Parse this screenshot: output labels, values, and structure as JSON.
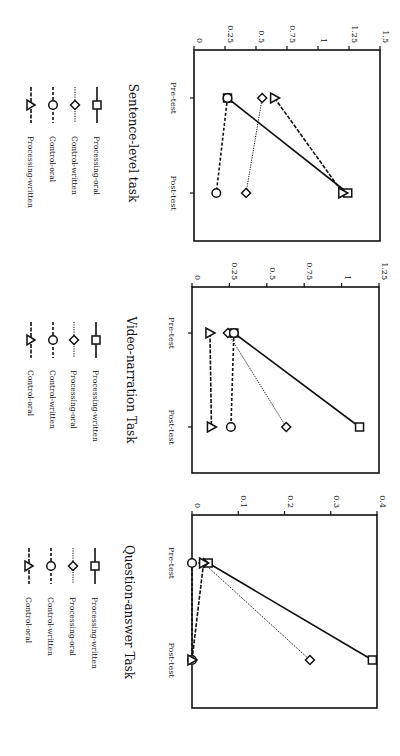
{
  "chart_data": [
    {
      "type": "line",
      "title": "Sentence-level task",
      "categories": [
        "Pre-test",
        "Post-test"
      ],
      "ylim": [
        0,
        1.5
      ],
      "yticks": [
        "0",
        "0.25",
        "0.5",
        "0.75",
        "1",
        "1.25",
        "1.5"
      ],
      "ytick_values": [
        0,
        0.25,
        0.5,
        0.75,
        1,
        1.25,
        1.5
      ],
      "grid": false,
      "legend_position": "left",
      "series": [
        {
          "name": "Processing-oral",
          "marker": "square",
          "line": "solid",
          "values": [
            0.27,
            1.24
          ]
        },
        {
          "name": "Control-written",
          "marker": "diamond",
          "line": "dotted",
          "values": [
            0.55,
            0.42
          ]
        },
        {
          "name": "Control-oral",
          "marker": "circle",
          "line": "dashed",
          "values": [
            0.27,
            0.18
          ]
        },
        {
          "name": "Processing-written",
          "marker": "triangle",
          "line": "dash-solid",
          "values": [
            0.65,
            1.2
          ]
        }
      ]
    },
    {
      "type": "line",
      "title": "Video-narration Task",
      "categories": [
        "Pre-test",
        "Post-test"
      ],
      "ylim": [
        0,
        1.25
      ],
      "yticks": [
        "0",
        "0.25",
        "0.5",
        "0.75",
        "1",
        "1.25"
      ],
      "ytick_values": [
        0,
        0.25,
        0.5,
        0.75,
        1,
        1.25
      ],
      "grid": false,
      "legend_position": "left",
      "series": [
        {
          "name": "Processing-written",
          "marker": "square",
          "line": "solid",
          "values": [
            0.28,
            1.12
          ]
        },
        {
          "name": "Processing-oral",
          "marker": "diamond",
          "line": "dotted",
          "values": [
            0.24,
            0.63
          ]
        },
        {
          "name": "Control-written",
          "marker": "circle",
          "line": "dashed",
          "values": [
            0.28,
            0.26
          ]
        },
        {
          "name": "Control-oral",
          "marker": "triangle",
          "line": "dash-solid",
          "values": [
            0.12,
            0.13
          ]
        }
      ]
    },
    {
      "type": "line",
      "title": "Question-answer Task",
      "categories": [
        "Pre-test",
        "Post-test"
      ],
      "ylim": [
        0,
        0.4
      ],
      "yticks": [
        "0",
        "0.1",
        "0.2",
        "0.3",
        "0.4"
      ],
      "ytick_values": [
        0,
        0.1,
        0.2,
        0.3,
        0.4
      ],
      "grid": false,
      "legend_position": "left",
      "series": [
        {
          "name": "Processing-written",
          "marker": "square",
          "line": "solid",
          "values": [
            0.035,
            0.39
          ]
        },
        {
          "name": "Processing-oral",
          "marker": "diamond",
          "line": "dotted",
          "values": [
            0.025,
            0.255
          ]
        },
        {
          "name": "Control-written",
          "marker": "circle",
          "line": "dashed",
          "values": [
            0.0,
            0.0
          ]
        },
        {
          "name": "Control-oral",
          "marker": "triangle",
          "line": "dash-solid",
          "values": [
            0.025,
            0.0
          ]
        }
      ]
    }
  ]
}
